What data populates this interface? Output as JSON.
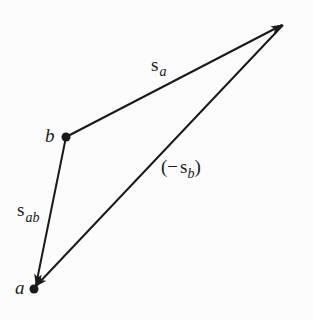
{
  "diagram": {
    "type": "vector-triangle",
    "colors": {
      "background": "#fcfcfc",
      "stroke": "#1a1a1a"
    },
    "points": {
      "b": {
        "label": "b",
        "x": 66,
        "y": 137
      },
      "apex": {
        "label": "",
        "x": 283,
        "y": 24
      },
      "a": {
        "label": "a",
        "x": 34,
        "y": 289
      }
    },
    "vectors": [
      {
        "id": "s_a",
        "from": "b",
        "to": "apex",
        "label_main": "s",
        "label_sub": "a",
        "prefix": "",
        "suffix": ""
      },
      {
        "id": "neg_s_b",
        "from": "apex",
        "to": "a",
        "label_main": "s",
        "label_sub": "b",
        "prefix": "(−",
        "suffix": ")"
      },
      {
        "id": "s_ab",
        "from": "b",
        "to": "a",
        "label_main": "s",
        "label_sub": "ab",
        "prefix": "",
        "suffix": ""
      }
    ]
  }
}
